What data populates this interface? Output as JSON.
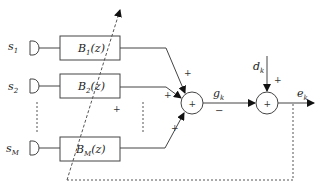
{
  "diagram": {
    "inputs": [
      {
        "label": "s",
        "sub": "1"
      },
      {
        "label": "s",
        "sub": "2"
      },
      {
        "label": "s",
        "sub": "M"
      }
    ],
    "filters": [
      {
        "name": "B",
        "sub": "1",
        "arg": "(z)"
      },
      {
        "name": "B",
        "sub": "2",
        "arg": "(z)"
      },
      {
        "name": "B",
        "sub": "M",
        "arg": "(z)"
      }
    ],
    "sum1": {
      "symbol": "+",
      "input_signs": [
        "+",
        "+",
        "+"
      ],
      "output_label": "g",
      "output_sub": "k",
      "output_sign": "−"
    },
    "sum2": {
      "symbol": "+",
      "disturbance_label": "d",
      "disturbance_sub": "k",
      "disturbance_sign": "+",
      "output_label": "e",
      "output_sub": "k"
    },
    "extra_sign": "+"
  }
}
